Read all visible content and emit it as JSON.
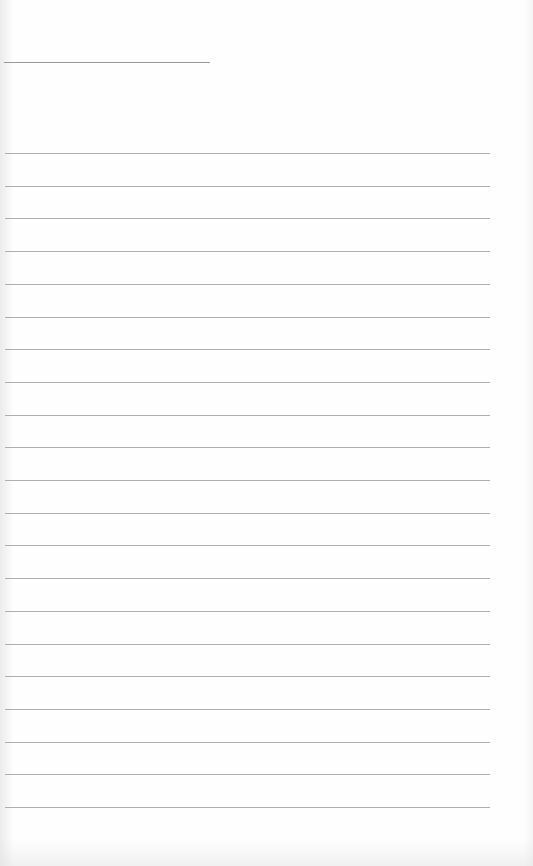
{
  "document": {
    "type": "ruled-paper",
    "background_color": "#fefefe",
    "line_color": "#aeaeae",
    "header_line": {
      "x": 4,
      "y": 62,
      "width": 206
    },
    "rules": {
      "count": 21,
      "start_y": 153,
      "spacing": 32.7,
      "x_start": 5,
      "x_end": 490
    },
    "text": ""
  }
}
